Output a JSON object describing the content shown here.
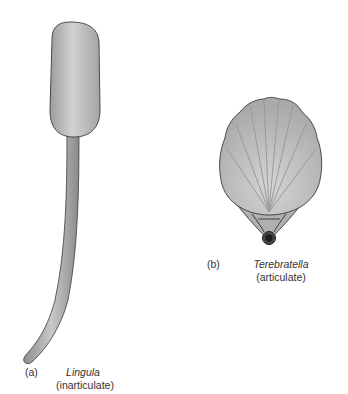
{
  "figures": [
    {
      "id": "a",
      "letter": "(a)",
      "genus": "Lingula",
      "type": "(inarticulate)"
    },
    {
      "id": "b",
      "letter": "(b)",
      "genus": "Terebratella",
      "type": "(articulate)"
    }
  ],
  "colors": {
    "shell_fill": "#b9b9b9",
    "outline": "#3a3a3a",
    "background": "#ffffff",
    "pedicle_opening": "#1e1e1e"
  }
}
